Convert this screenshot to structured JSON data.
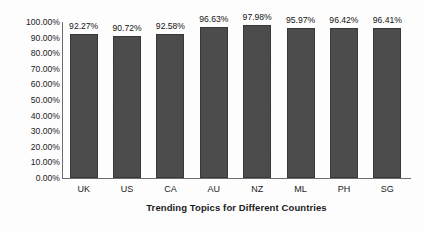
{
  "chart_data": {
    "type": "bar",
    "title": "",
    "xlabel": "Trending Topics for Different Countries",
    "ylabel": "Cumulative Percentage",
    "categories": [
      "UK",
      "US",
      "CA",
      "AU",
      "NZ",
      "ML",
      "PH",
      "SG"
    ],
    "values": [
      92.27,
      90.72,
      92.58,
      96.63,
      97.98,
      95.97,
      96.42,
      96.41
    ],
    "data_labels": [
      "92.27%",
      "90.72%",
      "92.58%",
      "96.63%",
      "97.98%",
      "95.97%",
      "96.42%",
      "96.41%"
    ],
    "ylim": [
      0,
      100
    ],
    "ytick_values": [
      0,
      10,
      20,
      30,
      40,
      50,
      60,
      70,
      80,
      90,
      100
    ],
    "ytick_labels": [
      "0.00%",
      "10.00%",
      "20.00%",
      "30.00%",
      "40.00%",
      "50.00%",
      "60.00%",
      "70.00%",
      "80.00%",
      "90.00%",
      "100.00%"
    ],
    "grid": false,
    "legend": false,
    "series_color": "#4c4c4c",
    "axis_color": "#6d6d6d"
  }
}
